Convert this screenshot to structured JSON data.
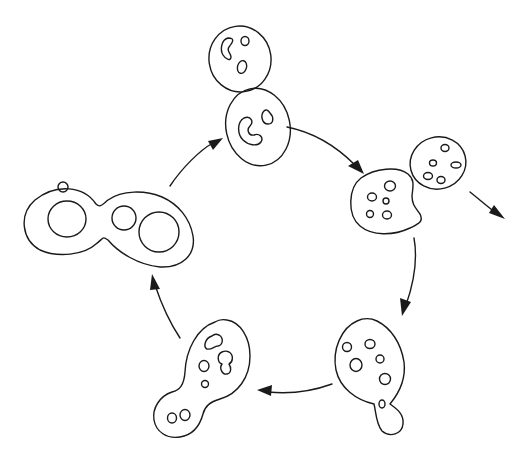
{
  "diagram": {
    "type": "cycle",
    "stroke_color": "#1a1a1a",
    "background": "#ffffff",
    "stages": [
      {
        "id": "stage-top",
        "label": "",
        "shape": "two stacked cells with kidney-shaped inclusions"
      },
      {
        "id": "stage-right",
        "label": "",
        "shape": "budding cell pair with many small vacuoles, exit arrow"
      },
      {
        "id": "stage-bottom-right",
        "label": "",
        "shape": "oval cell with small bud at bottom"
      },
      {
        "id": "stage-bottom-left",
        "label": "",
        "shape": "oval cell with large bud containing two vacuoles"
      },
      {
        "id": "stage-left",
        "label": "",
        "shape": "figure-eight dividing cell with large vacuoles"
      }
    ],
    "arrows": [
      {
        "from": "stage-top",
        "to": "stage-right"
      },
      {
        "from": "stage-right",
        "to": "stage-bottom-right"
      },
      {
        "from": "stage-bottom-right",
        "to": "stage-bottom-left"
      },
      {
        "from": "stage-bottom-left",
        "to": "stage-left"
      },
      {
        "from": "stage-left",
        "to": "stage-top"
      },
      {
        "from": "stage-right",
        "to": "exit"
      }
    ]
  }
}
